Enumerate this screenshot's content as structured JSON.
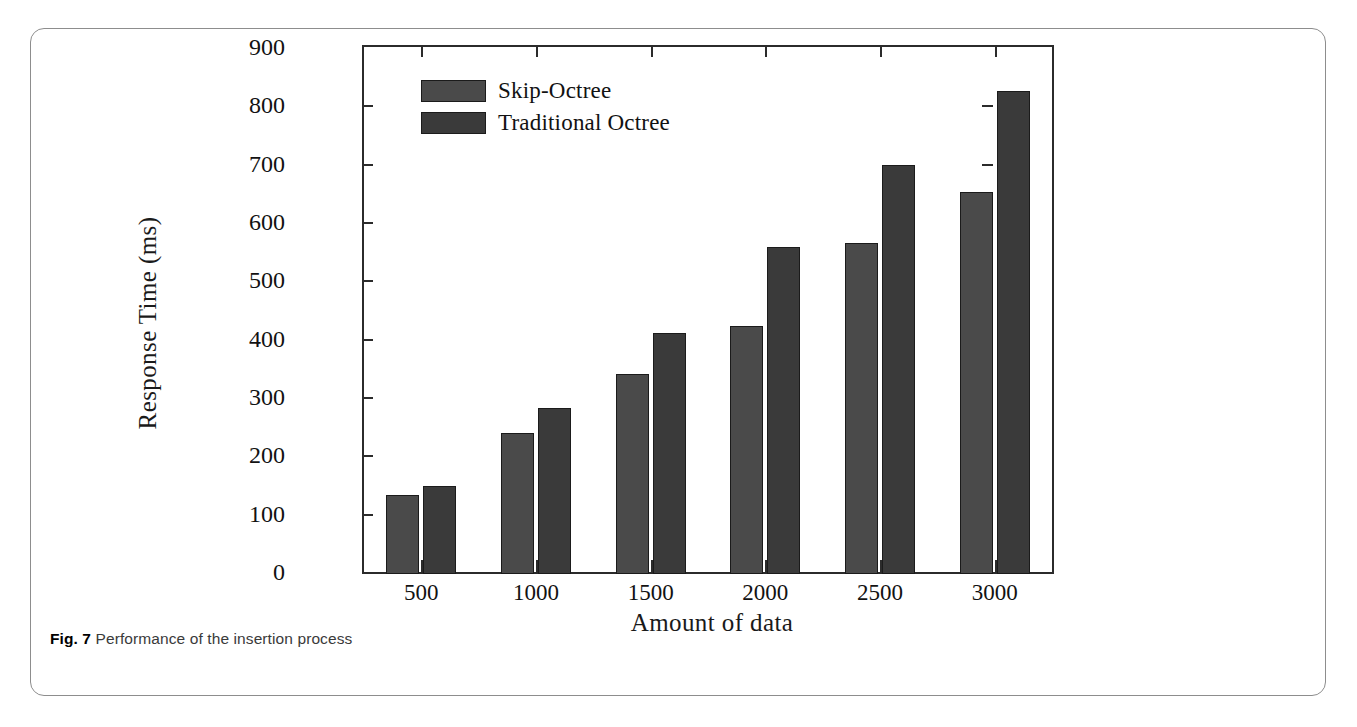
{
  "figure": {
    "caption_label": "Fig. 7",
    "caption_text": "Performance of the insertion process"
  },
  "colors": {
    "skip_octree_bar": "#4a4a4a",
    "traditional_octree_bar": "#3a3a3a",
    "axis": "#2b2b2b",
    "text": "#121212",
    "card_border": "#8d8d8d"
  },
  "chart_data": {
    "type": "bar",
    "title": "",
    "subtitle": "",
    "xlabel": "Amount of data",
    "ylabel": "Response Time (ms)",
    "categories": [
      "500",
      "1000",
      "1500",
      "2000",
      "2500",
      "3000"
    ],
    "series": [
      {
        "name": "Skip-Octree",
        "values": [
          136,
          242,
          343,
          426,
          567,
          655
        ],
        "color": "#4a4a4a"
      },
      {
        "name": "Traditional Octree",
        "values": [
          151,
          285,
          413,
          561,
          702,
          828
        ],
        "color": "#3a3a3a"
      }
    ],
    "ylim": [
      0,
      900
    ],
    "yticks": [
      0,
      100,
      200,
      300,
      400,
      500,
      600,
      700,
      800,
      900
    ],
    "ytick_labels": [
      "0",
      "100",
      "200",
      "300",
      "400",
      "500",
      "600",
      "700",
      "800",
      "900"
    ],
    "grid": false,
    "legend_position": "upper-left",
    "legend_entries": [
      "Skip-Octree",
      "Traditional Octree"
    ]
  }
}
